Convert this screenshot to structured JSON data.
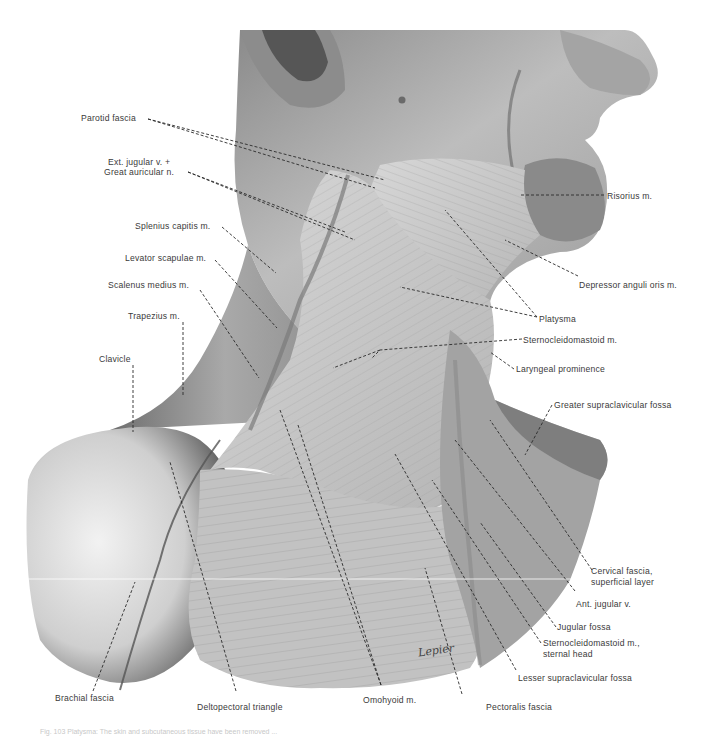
{
  "figure": {
    "signature": "Lepier",
    "colors": {
      "background": "#ffffff",
      "skin_light": "#e4e4e4",
      "skin_mid": "#a8a8a8",
      "skin_dark": "#4a4a4a",
      "muscle": "#c9c9c9",
      "label_text": "#3a3a3a",
      "leader_line": "#2a2a2a"
    },
    "labels_left": [
      {
        "id": "parotid-fascia",
        "text": "Parotid fascia"
      },
      {
        "id": "ext-jugular",
        "text": "Ext. jugular v. +"
      },
      {
        "id": "great-auricular",
        "text": "Great auricular n."
      },
      {
        "id": "splenius-capitis",
        "text": "Splenius capitis m."
      },
      {
        "id": "levator-scapulae",
        "text": "Levator scapulae m."
      },
      {
        "id": "scalenus-medius",
        "text": "Scalenus medius m."
      },
      {
        "id": "trapezius",
        "text": "Trapezius m."
      },
      {
        "id": "clavicle",
        "text": "Clavicle"
      }
    ],
    "labels_right": [
      {
        "id": "risorius",
        "text": "Risorius m."
      },
      {
        "id": "depressor-anguli-oris",
        "text": "Depressor anguli oris m."
      },
      {
        "id": "platysma",
        "text": "Platysma"
      },
      {
        "id": "sternocleidomastoid",
        "text": "Sternocleidomastoid m."
      },
      {
        "id": "laryngeal-prominence",
        "text": "Laryngeal prominence"
      },
      {
        "id": "greater-supraclavicular-fossa",
        "text": "Greater supraclavicular fossa"
      },
      {
        "id": "cervical-fascia-1",
        "text": "Cervical fascia,"
      },
      {
        "id": "cervical-fascia-2",
        "text": "superficial layer"
      },
      {
        "id": "ant-jugular",
        "text": "Ant. jugular v."
      },
      {
        "id": "jugular-fossa",
        "text": "Jugular fossa"
      },
      {
        "id": "scm-sternal-1",
        "text": "Sternocleidomastoid m.,"
      },
      {
        "id": "scm-sternal-2",
        "text": "sternal head"
      },
      {
        "id": "lesser-supraclavicular-fossa",
        "text": "Lesser supraclavicular fossa"
      }
    ],
    "labels_bottom": [
      {
        "id": "brachial-fascia",
        "text": "Brachial fascia"
      },
      {
        "id": "deltopectoral-triangle",
        "text": "Deltopectoral triangle"
      },
      {
        "id": "omohyoid",
        "text": "Omohyoid m."
      },
      {
        "id": "pectoralis-fascia",
        "text": "Pectoralis fascia"
      }
    ],
    "caption": "Fig. 103  Platysma: The skin and subcutaneous tissue have been removed ..."
  }
}
